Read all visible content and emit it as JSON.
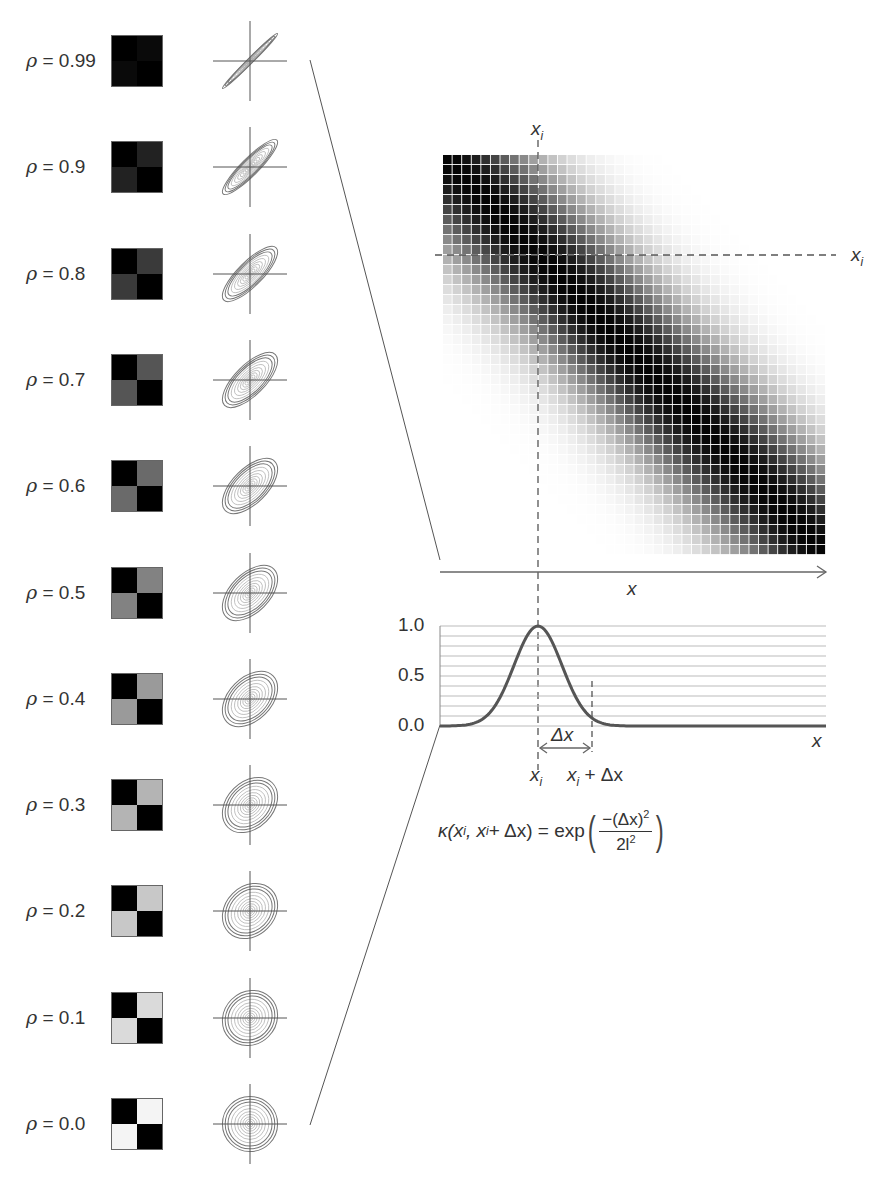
{
  "figure": {
    "rows": [
      {
        "rho": "0.99",
        "label": "ρ = 0.99",
        "offdiag_gray": "#0a0a0a"
      },
      {
        "rho": "0.9",
        "label": "ρ = 0.9",
        "offdiag_gray": "#222222"
      },
      {
        "rho": "0.8",
        "label": "ρ = 0.8",
        "offdiag_gray": "#3a3a3a"
      },
      {
        "rho": "0.7",
        "label": "ρ = 0.7",
        "offdiag_gray": "#555555"
      },
      {
        "rho": "0.6",
        "label": "ρ = 0.6",
        "offdiag_gray": "#6a6a6a"
      },
      {
        "rho": "0.5",
        "label": "ρ = 0.5",
        "offdiag_gray": "#828282"
      },
      {
        "rho": "0.4",
        "label": "ρ = 0.4",
        "offdiag_gray": "#9a9a9a"
      },
      {
        "rho": "0.3",
        "label": "ρ = 0.3",
        "offdiag_gray": "#b4b4b4"
      },
      {
        "rho": "0.2",
        "label": "ρ = 0.2",
        "offdiag_gray": "#c8c8c8"
      },
      {
        "rho": "0.1",
        "label": "ρ = 0.1",
        "offdiag_gray": "#dadada"
      },
      {
        "rho": "0.0",
        "label": "ρ = 0.0",
        "offdiag_gray": "#f4f4f4"
      }
    ],
    "heatmap": {
      "grid_size": 40,
      "top_label": "x_i",
      "right_label": "x_i",
      "x_axis_label": "x"
    },
    "kernel_plot": {
      "y_ticks": [
        "1.0",
        "0.5",
        "0.0"
      ],
      "x_axis_label": "x",
      "xi_label": "x",
      "xi_sub": "i",
      "xi_plus_label": "x",
      "xi_plus_sub": "i",
      "xi_plus_suffix": " + Δx",
      "delta_label": "Δx",
      "gridline_count": 11
    },
    "formula": {
      "lhs": "κ(x",
      "lhs_sub": "i",
      "lhs_mid": ", x",
      "lhs_sub2": "i",
      "lhs_end": " + Δx) = exp",
      "numerator": "−(Δx)",
      "numerator_sup": "2",
      "denominator": "2l",
      "denominator_sup": "2"
    }
  },
  "chart_data": {
    "type": "line",
    "title": "",
    "xlabel": "x",
    "ylabel": "",
    "y_ticks": [
      0.0,
      0.5,
      1.0
    ],
    "ylim": [
      0,
      1.0
    ],
    "grid": true,
    "annotations": [
      "x_i",
      "x_i + Δx",
      "Δx",
      "κ(x_i, x_i + Δx) = exp(−(Δx)^2 / 2l^2)"
    ],
    "series": [
      {
        "name": "squared exponential kernel κ(x_i, x)",
        "x": [
          -4,
          -3,
          -2,
          -1.5,
          -1,
          -0.5,
          0,
          0.5,
          1,
          1.5,
          2,
          3,
          4,
          6,
          8,
          10,
          12
        ],
        "values": [
          0.0,
          0.01,
          0.14,
          0.32,
          0.61,
          0.88,
          1.0,
          0.88,
          0.61,
          0.32,
          0.14,
          0.01,
          0.0,
          0.0,
          0.0,
          0.0,
          0.0
        ]
      }
    ],
    "correlation_panels": {
      "rho_values": [
        0.99,
        0.9,
        0.8,
        0.7,
        0.6,
        0.5,
        0.4,
        0.3,
        0.2,
        0.1,
        0.0
      ]
    }
  }
}
